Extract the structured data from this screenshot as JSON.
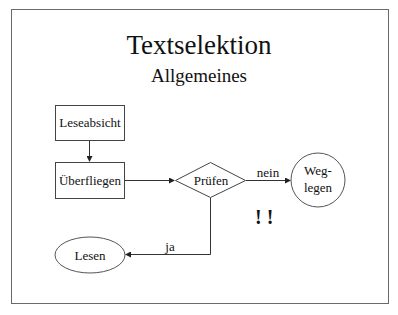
{
  "slide": {
    "title": "Textselektion",
    "subtitle": "Allgemeines"
  },
  "flowchart": {
    "nodes": [
      {
        "id": "leseabsicht",
        "shape": "rectangle",
        "label": "Leseabsicht"
      },
      {
        "id": "ueberfliegen",
        "shape": "rectangle",
        "label": "Überfliegen"
      },
      {
        "id": "pruefen",
        "shape": "diamond",
        "label": "Prüfen"
      },
      {
        "id": "weglegen",
        "shape": "circle",
        "label_line1": "Weg-",
        "label_line2": "legen"
      },
      {
        "id": "lesen",
        "shape": "ellipse",
        "label": "Lesen"
      }
    ],
    "edges": [
      {
        "from": "leseabsicht",
        "to": "ueberfliegen",
        "label": ""
      },
      {
        "from": "ueberfliegen",
        "to": "pruefen",
        "label": ""
      },
      {
        "from": "pruefen",
        "to": "weglegen",
        "label": "nein"
      },
      {
        "from": "pruefen",
        "to": "lesen",
        "label": "ja"
      }
    ],
    "annotation": "! !"
  }
}
